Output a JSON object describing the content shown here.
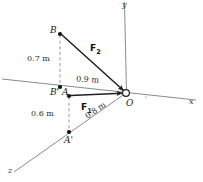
{
  "figure": {
    "type": "free-body-diagram-3d",
    "background": "#ffffff",
    "line_color": "#4a4a4a",
    "vector_color": "#222222"
  },
  "axes": [
    {
      "id": "y",
      "label": "y",
      "direction": "vertical-up"
    },
    {
      "id": "x",
      "label": "x",
      "direction": "right"
    },
    {
      "id": "z",
      "label": "z",
      "direction": "lower-left"
    }
  ],
  "points": [
    {
      "id": "O",
      "label": "O",
      "marker": "open-circle"
    },
    {
      "id": "B",
      "label": "B",
      "marker": "filled-dot"
    },
    {
      "id": "Bp",
      "label": "B'",
      "marker": "filled-dot"
    },
    {
      "id": "A",
      "label": "A",
      "marker": "filled-dot"
    },
    {
      "id": "Ap",
      "label": "A'",
      "marker": "filled-dot"
    }
  ],
  "forces": [
    {
      "id": "F1",
      "label": "F",
      "subscript": "1",
      "from": "A",
      "to": "O"
    },
    {
      "id": "F2",
      "label": "F",
      "subscript": "2",
      "from": "B",
      "to": "O"
    }
  ],
  "dimensions": [
    {
      "id": "d-b-height",
      "value": "0.7 m",
      "between": "B to B'",
      "style": "dashed-vertical"
    },
    {
      "id": "d-bp-origin",
      "value": "0.9 m",
      "between": "B' to O",
      "style": "solid-horizontal"
    },
    {
      "id": "d-a-height",
      "value": "0.6 m",
      "between": "A to A'",
      "style": "dashed-vertical"
    },
    {
      "id": "d-ap-origin",
      "value": "0.8 m",
      "between": "A' to O",
      "style": "solid-diagonal"
    }
  ]
}
